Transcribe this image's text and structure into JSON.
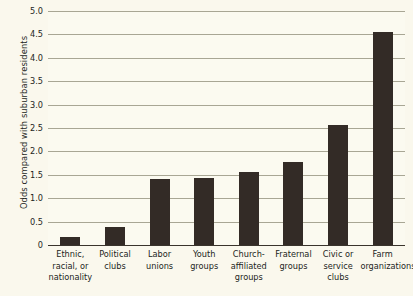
{
  "chart_data": {
    "type": "bar",
    "title": "",
    "subtitle": "",
    "xlabel": "",
    "ylabel": "Odds compared with suburban residents",
    "ylim": [
      0,
      5.0
    ],
    "grid": "horizontal",
    "legend": "none",
    "orientation": "vertical",
    "bar_color": "#332b26",
    "background_color": "#faf8ed",
    "gridline_color": "#a8a694",
    "axis_color": "#3a342c",
    "y_ticks": [
      "0",
      "0.5",
      "1.0",
      "1.5",
      "2.0",
      "2.5",
      "3.0",
      "3.5",
      "4.0",
      "4.5",
      "5.0"
    ],
    "y_tick_values": [
      0,
      0.5,
      1.0,
      1.5,
      2.0,
      2.5,
      3.0,
      3.5,
      4.0,
      4.5,
      5.0
    ],
    "categories": [
      "Ethnic,\nracial, or\nnationality",
      "Political\nclubs",
      "Labor\nunions",
      "Youth\ngroups",
      "Church-\naffiliated\ngroups",
      "Fraternal\ngroups",
      "Civic or\nservice\nclubs",
      "Farm\norganizations"
    ],
    "values": [
      0.18,
      0.38,
      1.42,
      1.43,
      1.55,
      1.77,
      2.57,
      4.55
    ]
  }
}
